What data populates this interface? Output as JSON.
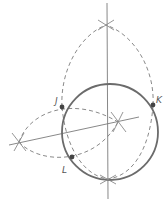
{
  "diagram": {
    "title": "",
    "colors": {
      "circle": "#6b6b6b",
      "construction": "#8a8a8a",
      "point": "#444444",
      "label": "#555555"
    },
    "circle": {
      "cx": 110,
      "cy": 132,
      "r": 48
    },
    "points": [
      {
        "name": "J",
        "x": 62,
        "y": 107,
        "label_x": 55,
        "label_y": 104
      },
      {
        "name": "K",
        "x": 153,
        "y": 105,
        "label_x": 156,
        "label_y": 103
      },
      {
        "name": "L",
        "x": 72,
        "y": 157,
        "label_x": 62,
        "label_y": 173
      }
    ],
    "labels": {
      "J": "J",
      "K": "K",
      "L": "L"
    }
  }
}
